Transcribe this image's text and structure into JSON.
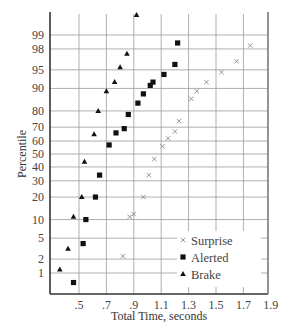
{
  "chart_data": {
    "type": "scatter",
    "title": "",
    "xlabel": "Total Time, seconds",
    "ylabel": "Percentile",
    "xlim": [
      0.33,
      1.92
    ],
    "x_ticks": [
      ".5",
      ".7",
      ".9",
      "1.1",
      "1.3",
      "1.5",
      "1.7",
      "1.9"
    ],
    "x_tick_values": [
      0.5,
      0.7,
      0.9,
      1.1,
      1.3,
      1.5,
      1.7,
      1.9
    ],
    "y_scale": "normal-probability",
    "y_ticks": [
      "1",
      "2",
      "5",
      "10",
      "20",
      "30",
      "40",
      "50",
      "60",
      "70",
      "80",
      "90",
      "95",
      "98",
      "99"
    ],
    "y_tick_values": [
      1,
      2,
      5,
      10,
      20,
      30,
      40,
      50,
      60,
      70,
      80,
      90,
      95,
      98,
      99
    ],
    "grid": true,
    "legend_position": "lower right",
    "series": [
      {
        "name": "Surprise",
        "marker": "x",
        "color": "#888888",
        "points": [
          {
            "x": 0.82,
            "y": 2.3
          },
          {
            "x": 0.87,
            "y": 11
          },
          {
            "x": 0.9,
            "y": 12
          },
          {
            "x": 0.97,
            "y": 20
          },
          {
            "x": 1.01,
            "y": 34
          },
          {
            "x": 1.05,
            "y": 46
          },
          {
            "x": 1.11,
            "y": 56
          },
          {
            "x": 1.15,
            "y": 62
          },
          {
            "x": 1.2,
            "y": 67
          },
          {
            "x": 1.23,
            "y": 74
          },
          {
            "x": 1.32,
            "y": 86
          },
          {
            "x": 1.36,
            "y": 89
          },
          {
            "x": 1.43,
            "y": 92
          },
          {
            "x": 1.54,
            "y": 94.5
          },
          {
            "x": 1.65,
            "y": 96.5
          },
          {
            "x": 1.75,
            "y": 98.3
          }
        ]
      },
      {
        "name": "Alerted",
        "marker": "square",
        "color": "#111111",
        "points": [
          {
            "x": 0.46,
            "y": 0.6
          },
          {
            "x": 0.53,
            "y": 4
          },
          {
            "x": 0.55,
            "y": 10
          },
          {
            "x": 0.62,
            "y": 20
          },
          {
            "x": 0.65,
            "y": 34
          },
          {
            "x": 0.72,
            "y": 57
          },
          {
            "x": 0.77,
            "y": 66
          },
          {
            "x": 0.83,
            "y": 69
          },
          {
            "x": 0.86,
            "y": 78
          },
          {
            "x": 0.93,
            "y": 84
          },
          {
            "x": 0.97,
            "y": 88
          },
          {
            "x": 1.02,
            "y": 91
          },
          {
            "x": 1.04,
            "y": 92
          },
          {
            "x": 1.12,
            "y": 94
          },
          {
            "x": 1.2,
            "y": 96
          },
          {
            "x": 1.22,
            "y": 98.5
          }
        ]
      },
      {
        "name": "Brake",
        "marker": "triangle",
        "color": "#111111",
        "points": [
          {
            "x": 0.36,
            "y": 1.2
          },
          {
            "x": 0.42,
            "y": 3.2
          },
          {
            "x": 0.46,
            "y": 11
          },
          {
            "x": 0.52,
            "y": 20
          },
          {
            "x": 0.54,
            "y": 44
          },
          {
            "x": 0.61,
            "y": 65
          },
          {
            "x": 0.64,
            "y": 80
          },
          {
            "x": 0.7,
            "y": 89
          },
          {
            "x": 0.76,
            "y": 92
          },
          {
            "x": 0.8,
            "y": 95.5
          },
          {
            "x": 0.85,
            "y": 97.5
          },
          {
            "x": 0.92,
            "y": 99.8
          }
        ]
      }
    ]
  },
  "legend": {
    "items": [
      {
        "label": "Surprise",
        "marker": "x"
      },
      {
        "label": "Alerted",
        "marker": "square"
      },
      {
        "label": "Brake",
        "marker": "triangle"
      }
    ]
  },
  "colors": {
    "grid": "#9a9a9a",
    "axis": "#333333",
    "surprise": "#8a8a8a",
    "markers": "#111111"
  }
}
